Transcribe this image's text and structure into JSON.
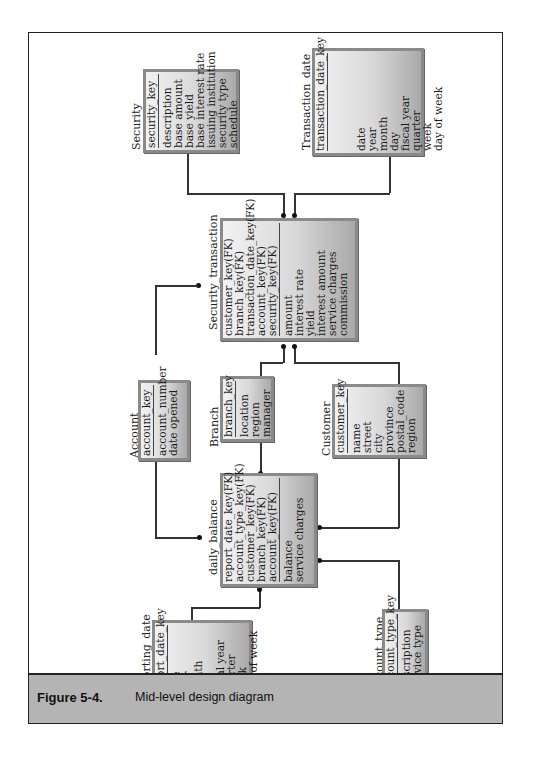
{
  "figure": {
    "number": "Figure 5-4.",
    "title": "Mid-level design diagram"
  },
  "entities": {
    "security": {
      "name": "Security",
      "key": "security_key",
      "attributes": [
        "description",
        "base amount",
        "base yield",
        "base interest rate",
        "issuing institution",
        "security type",
        "schedule"
      ]
    },
    "transaction_date": {
      "name": "Transaction_date",
      "key": "transaction_date_key",
      "attributes": [
        "date",
        "year",
        "month",
        "day",
        "fiscal year",
        "quarter",
        "week",
        "day of week"
      ]
    },
    "security_transaction": {
      "name": "Security_transaction",
      "keys": [
        "customer_key(FK)",
        "branch_key(FK)",
        "transaction_date_key(FK)",
        "account_key(FK)",
        "security_key(FK)"
      ],
      "attributes": [
        "amount",
        "interest rate",
        "yield",
        "interest amount",
        "service charges",
        "commission"
      ]
    },
    "account": {
      "name": "Account",
      "key": "account_key",
      "attributes": [
        "account_number",
        "date opened"
      ]
    },
    "branch": {
      "name": "Branch",
      "key": "branch_key",
      "attributes": [
        "location",
        "region",
        "manager"
      ]
    },
    "customer": {
      "name": "Customer",
      "key": "customer_key",
      "attributes": [
        "name",
        "street",
        "city",
        "province",
        "postal_code",
        "region"
      ]
    },
    "daily_balance": {
      "name": "daily_balance",
      "keys": [
        "report_date_key(FK)",
        "account_type_key(FK)",
        "customer_key(FK)",
        "branch_key(FK)",
        "account_key(FK)"
      ],
      "attributes": [
        "balance",
        "service charges"
      ]
    },
    "reporting_date": {
      "name": "Reporting_date",
      "key": "report_date_key",
      "attributes": [
        "date",
        "year",
        "month",
        "day",
        "fiscal year",
        "quarter",
        "week",
        "day of week"
      ]
    },
    "account_type": {
      "name": "Account_type",
      "key": "account_type_key",
      "attributes": [
        "description",
        "service type"
      ]
    }
  },
  "relationships": [
    {
      "from": "Security",
      "to": "Security_transaction"
    },
    {
      "from": "Transaction_date",
      "to": "Security_transaction"
    },
    {
      "from": "Account",
      "to": "Security_transaction"
    },
    {
      "from": "Branch",
      "to": "Security_transaction"
    },
    {
      "from": "Customer",
      "to": "Security_transaction"
    },
    {
      "from": "Account",
      "to": "daily_balance"
    },
    {
      "from": "Branch",
      "to": "daily_balance"
    },
    {
      "from": "Customer",
      "to": "daily_balance"
    },
    {
      "from": "Reporting_date",
      "to": "daily_balance"
    },
    {
      "from": "Account_type",
      "to": "daily_balance"
    }
  ]
}
